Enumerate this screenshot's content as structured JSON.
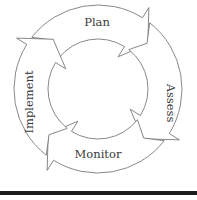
{
  "diagram": {
    "type": "cycle",
    "direction": "clockwise",
    "steps": [
      {
        "label": "Plan"
      },
      {
        "label": "Assess"
      },
      {
        "label": "Monitor"
      },
      {
        "label": "Implement"
      }
    ]
  },
  "colors": {
    "stroke": "#6a6a6a",
    "fill": "#ffffff",
    "text": "#3a3a3a",
    "rule": "#1c1c1c"
  }
}
